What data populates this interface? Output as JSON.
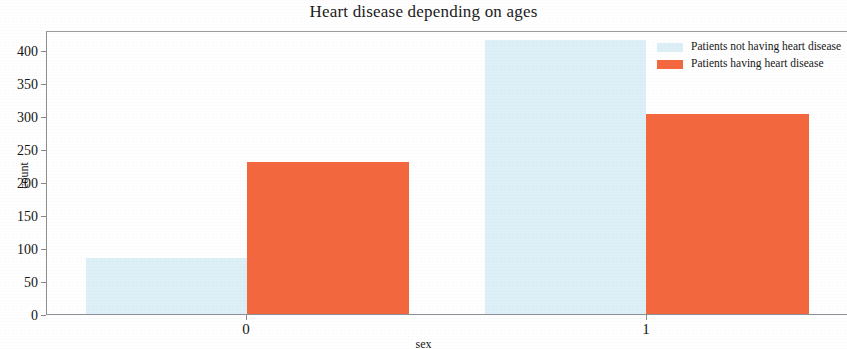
{
  "chart_data": {
    "type": "bar",
    "title": "Heart disease depending on ages",
    "xlabel": "sex",
    "ylabel": "count",
    "categories": [
      "0",
      "1"
    ],
    "series": [
      {
        "name": "Patients not having heart disease",
        "color": "#ddf0f7",
        "values": [
          86,
          413
        ]
      },
      {
        "name": "Patients having heart disease",
        "color": "#f4683f",
        "values": [
          230,
          302
        ]
      }
    ],
    "ylim": [
      0,
      425
    ],
    "yticks": [
      0,
      50,
      100,
      150,
      200,
      250,
      300,
      350,
      400
    ],
    "ytick_labels": [
      "0",
      "50",
      "100",
      "150",
      "200",
      "250",
      "300",
      "350",
      "400"
    ],
    "xticks": [
      0,
      1
    ],
    "xtick_labels": [
      "0",
      "1"
    ],
    "grid": false,
    "legend_position": "top-right",
    "bar_style": "grouped-adjacent"
  },
  "legend": {
    "entries": [
      {
        "label": "Patients not having heart disease",
        "swatch": "no-disease"
      },
      {
        "label": "Patients having heart disease",
        "swatch": "has-disease"
      }
    ]
  }
}
